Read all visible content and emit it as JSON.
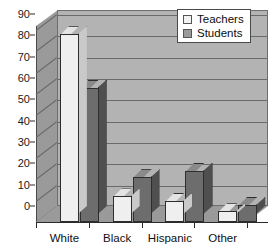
{
  "chart_data": {
    "type": "bar",
    "title": "",
    "subtitle": "",
    "xlabel": "",
    "ylabel": "",
    "categories": [
      "White",
      "Black",
      "Hispanic",
      "Other"
    ],
    "series": [
      {
        "name": "Teachers",
        "values": [
          88,
          12,
          10,
          5
        ],
        "color": "#efefef"
      },
      {
        "name": "Students",
        "values": [
          63,
          21,
          24,
          8
        ],
        "color": "#6d6d6d"
      }
    ],
    "ylim": [
      0,
      90
    ],
    "ytick_values": [
      0,
      10,
      20,
      30,
      40,
      50,
      60,
      70,
      80,
      90
    ],
    "ytick_labels": [
      "0",
      "10",
      "20",
      "30",
      "40",
      "50",
      "60",
      "70",
      "80",
      "90"
    ],
    "grid": true,
    "grid_axis": "y",
    "legend_position": "top-right",
    "style": "3d-clustered-column"
  },
  "legend": {
    "items": [
      {
        "label": "Teachers",
        "swatch": "teachers"
      },
      {
        "label": "Students",
        "swatch": "students"
      }
    ]
  },
  "colors": {
    "plot_background": "#b3b3b3",
    "wall_side": "#9a9a9a",
    "gridline": "#6a6a6a",
    "axis": "#2b2b2b",
    "teachers_fill": "#efefef",
    "students_fill": "#6d6d6d",
    "text": "#101010",
    "page_background": "#ffffff"
  }
}
